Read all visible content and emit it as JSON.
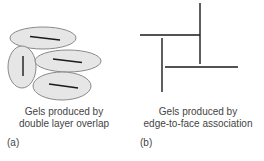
{
  "panels": [
    {
      "id": "a",
      "label": "(a)",
      "caption_line1": "Gels produced by",
      "caption_line2": "double layer overlap",
      "particles": [
        {
          "cx": 43,
          "cy": 38,
          "rx": 33,
          "ry": 11,
          "rot": 0,
          "line": [
            30,
            36.5,
            60,
            40
          ]
        },
        {
          "cx": 22,
          "cy": 67,
          "rx": 14,
          "ry": 21,
          "rot": 0,
          "line": [
            23,
            56,
            23,
            76
          ]
        },
        {
          "cx": 68,
          "cy": 61,
          "rx": 33,
          "ry": 11,
          "rot": 0,
          "line": [
            53,
            59,
            82,
            62.5
          ]
        },
        {
          "cx": 62,
          "cy": 86,
          "rx": 29,
          "ry": 14,
          "rot": 0,
          "line": [
            49,
            84,
            78,
            88
          ]
        }
      ]
    },
    {
      "id": "b",
      "label": "(b)",
      "caption_line1": "Gels produced by",
      "caption_line2": "edge-to-face association",
      "plates": [
        [
          140,
          35,
          200,
          35
        ],
        [
          200,
          3,
          200,
          64
        ],
        [
          162,
          38,
          162,
          92
        ],
        [
          165,
          67,
          238,
          67
        ]
      ]
    }
  ],
  "colors": {
    "particle_fill": "#e6e6e6",
    "particle_stroke": "#8a8a8a",
    "plate": "#1a1a1a",
    "text": "#444444"
  }
}
